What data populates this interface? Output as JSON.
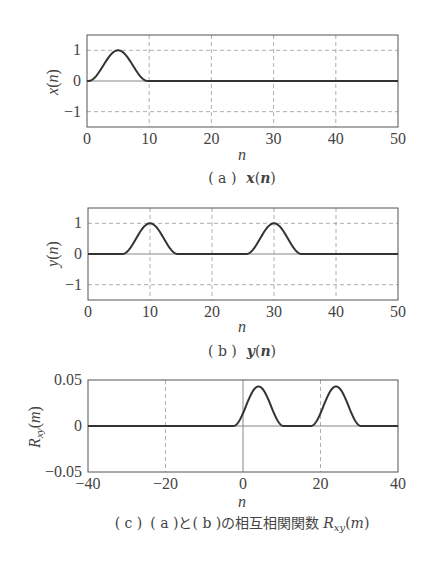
{
  "chart_data": [
    {
      "id": "a",
      "type": "line",
      "title": "",
      "caption_prefix": "( a )",
      "caption_expr": "x(n)",
      "xlabel": "n",
      "ylabel": "x(n)",
      "xlim": [
        0,
        50
      ],
      "ylim": [
        -1.5,
        1.5
      ],
      "xticks": [
        0,
        10,
        20,
        30,
        40,
        50
      ],
      "yticks": [
        -1,
        0,
        1
      ],
      "ytick_labels": [
        "−1",
        "0",
        "1"
      ],
      "grid": true,
      "series": [
        {
          "name": "x(n)",
          "bumps": [
            {
              "center": 5,
              "halfwidth": 4.8,
              "amp": 1
            }
          ]
        }
      ]
    },
    {
      "id": "b",
      "type": "line",
      "title": "",
      "caption_prefix": "( b )",
      "caption_expr": "y(n)",
      "xlabel": "n",
      "ylabel": "y(n)",
      "xlim": [
        0,
        50
      ],
      "ylim": [
        -1.5,
        1.5
      ],
      "xticks": [
        0,
        10,
        20,
        30,
        40,
        50
      ],
      "yticks": [
        -1,
        0,
        1
      ],
      "ytick_labels": [
        "−1",
        "0",
        "1"
      ],
      "grid": true,
      "series": [
        {
          "name": "y(n)",
          "bumps": [
            {
              "center": 10,
              "halfwidth": 4.5,
              "amp": 1
            },
            {
              "center": 30,
              "halfwidth": 4.5,
              "amp": 1
            }
          ]
        }
      ]
    },
    {
      "id": "c",
      "type": "line",
      "title": "",
      "caption_prefix": "( c )",
      "caption_expr": "( a )と( b )の相互相関関数 Rxy(m)",
      "xlabel": "n",
      "ylabel": "Rxy(m)",
      "xlim": [
        -40,
        40
      ],
      "ylim": [
        -0.05,
        0.05
      ],
      "xticks": [
        -40,
        -20,
        0,
        20,
        40
      ],
      "xtick_labels": [
        "−40",
        "−20",
        "0",
        "20",
        "40"
      ],
      "yticks": [
        -0.05,
        0,
        0.05
      ],
      "ytick_labels": [
        "−0.05",
        "0",
        "0.05"
      ],
      "grid": true,
      "series": [
        {
          "name": "Rxy(m)",
          "bumps": [
            {
              "center": 4,
              "halfwidth": 6.5,
              "amp": 0.043
            },
            {
              "center": 24,
              "halfwidth": 6.5,
              "amp": 0.043
            }
          ]
        }
      ]
    }
  ],
  "captions": {
    "a": {
      "prefix": "( a )",
      "expr_fn": "x",
      "expr_arg": "n"
    },
    "b": {
      "prefix": "( b )",
      "expr_fn": "y",
      "expr_arg": "n"
    },
    "c": {
      "prefix": "( c )",
      "text": "( a )と( b )の相互相関関数",
      "expr_fn": "R",
      "expr_sub": "xy",
      "expr_arg": "m"
    }
  },
  "axis_labels": {
    "a": {
      "x": "n",
      "y_fn": "x",
      "y_arg": "n"
    },
    "b": {
      "x": "n",
      "y_fn": "y",
      "y_arg": "n"
    },
    "c": {
      "x": "n",
      "y_fn": "R",
      "y_sub": "xy",
      "y_arg": "m"
    }
  }
}
